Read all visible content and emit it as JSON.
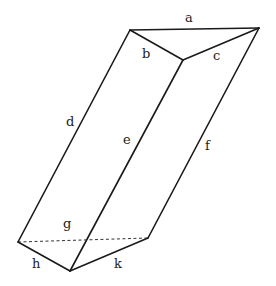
{
  "diagram": {
    "type": "triangular-prism",
    "labels": {
      "a": "a",
      "b": "b",
      "c": "c",
      "d": "d",
      "e": "e",
      "f": "f",
      "g": "g",
      "h": "h",
      "k": "k"
    }
  }
}
